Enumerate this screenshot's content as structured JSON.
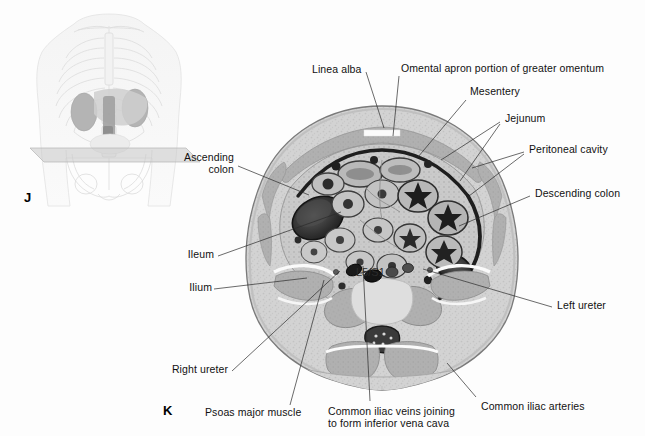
{
  "figure": {
    "panels": [
      {
        "letter": "J",
        "name": "orientation-thumbnail"
      },
      {
        "letter": "K",
        "name": "axial-section"
      }
    ],
    "disc_label": "L5/S1"
  },
  "labels": {
    "linea_alba": "Linea alba",
    "omental_apron": "Omental apron portion of greater omentum",
    "mesentery": "Mesentery",
    "jejunum": "Jejunum",
    "peritoneal_cavity": "Peritoneal cavity",
    "descending_colon": "Descending colon",
    "left_ureter": "Left ureter",
    "ascending_colon_l1": "Ascending",
    "ascending_colon_l2": "colon",
    "ileum": "Ileum",
    "ilium": "Ilium",
    "right_ureter": "Right ureter",
    "psoas_major": "Psoas major muscle",
    "iliac_veins_l1": "Common iliac veins joining",
    "iliac_veins_l2": "to form inferior vena cava",
    "iliac_arteries": "Common iliac arteries"
  },
  "colors": {
    "background": "#fdfdfd",
    "leader_line": "#2b2b2b",
    "text": "#111111",
    "skin_outline": "#6f6f6f",
    "fat_light": "#d9d9d9",
    "muscle_mid": "#a9a9a9",
    "bowel_dark": "#2e2e2e",
    "bone_light": "#ededed",
    "plane_gray": "#d0d0d0"
  }
}
